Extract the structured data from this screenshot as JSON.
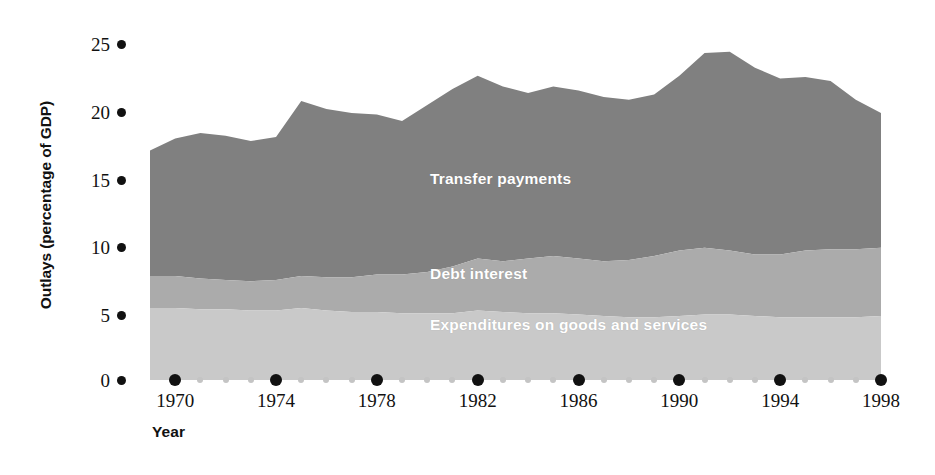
{
  "chart_data": {
    "type": "area",
    "title": "",
    "subtitle": "",
    "xlabel": "Year",
    "ylabel": "Outlays (percentage of GDP)",
    "xlim": [
      1969,
      1998
    ],
    "ylim": [
      0,
      26
    ],
    "grid": false,
    "legend_position": "inline-labels",
    "stacked": true,
    "annotations": [
      "Transfer payments",
      "Debt interest",
      "Expenditures on goods and services"
    ],
    "y_ticks": [
      0,
      5,
      10,
      15,
      20,
      25
    ],
    "x_ticks": [
      1970,
      1974,
      1978,
      1982,
      1986,
      1990,
      1994,
      1998
    ],
    "x_minor_ticks": [
      1971,
      1972,
      1973,
      1975,
      1976,
      1977,
      1979,
      1980,
      1981,
      1983,
      1984,
      1985,
      1987,
      1988,
      1989,
      1991,
      1992,
      1993,
      1995,
      1996,
      1997
    ],
    "x": [
      1969,
      1970,
      1971,
      1972,
      1973,
      1974,
      1975,
      1976,
      1977,
      1978,
      1979,
      1980,
      1981,
      1982,
      1983,
      1984,
      1985,
      1986,
      1987,
      1988,
      1989,
      1990,
      1991,
      1992,
      1993,
      1994,
      1995,
      1996,
      1997,
      1998
    ],
    "series": [
      {
        "name": "Expenditures on goods and services",
        "color": "#c9c9c9",
        "values": [
          5.4,
          5.4,
          5.3,
          5.3,
          5.2,
          5.2,
          5.4,
          5.2,
          5.1,
          5.1,
          5.0,
          5.0,
          5.0,
          5.2,
          5.1,
          5.0,
          5.0,
          4.9,
          4.8,
          4.7,
          4.7,
          4.8,
          4.9,
          4.9,
          4.8,
          4.7,
          4.7,
          4.7,
          4.7,
          4.8
        ]
      },
      {
        "name": "Debt interest",
        "color": "#ababab",
        "values": [
          2.4,
          2.4,
          2.3,
          2.2,
          2.2,
          2.3,
          2.4,
          2.5,
          2.6,
          2.8,
          2.9,
          3.1,
          3.5,
          3.9,
          3.8,
          4.1,
          4.3,
          4.2,
          4.1,
          4.3,
          4.6,
          4.9,
          5.0,
          4.8,
          4.6,
          4.7,
          5.0,
          5.1,
          5.1,
          5.1
        ]
      },
      {
        "name": "Transfer payments",
        "color": "#808080",
        "values": [
          9.4,
          10.3,
          10.9,
          10.8,
          10.5,
          10.7,
          13.1,
          12.6,
          12.3,
          12.0,
          11.5,
          12.5,
          13.3,
          13.7,
          13.1,
          12.4,
          12.7,
          12.6,
          12.3,
          12.0,
          12.1,
          13.1,
          14.6,
          14.9,
          14.0,
          13.2,
          13.0,
          12.6,
          11.2,
          10.1
        ]
      }
    ],
    "totals": [
      17.2,
      18.1,
      18.5,
      18.3,
      17.9,
      18.2,
      20.9,
      20.3,
      20.0,
      19.9,
      19.4,
      20.6,
      21.8,
      22.8,
      22.0,
      21.5,
      22.0,
      21.7,
      21.2,
      21.0,
      21.4,
      22.8,
      24.5,
      24.6,
      23.4,
      22.6,
      22.7,
      22.4,
      21.0,
      20.0
    ]
  },
  "axes": {
    "y_title": "Outlays (percentage of GDP)",
    "x_title": "Year",
    "y_tick_labels": [
      "25",
      "20",
      "15",
      "10",
      "5",
      "0"
    ],
    "x_tick_labels": [
      "1970",
      "1974",
      "1978",
      "1982",
      "1986",
      "1990",
      "1994",
      "1998"
    ]
  },
  "labels": {
    "transfer": "Transfer payments",
    "debt": "Debt interest",
    "expenditures": "Expenditures on goods and services"
  },
  "colors": {
    "transfer_payments": "#808080",
    "debt_interest": "#ababab",
    "expenditures": "#c9c9c9",
    "axis_text": "#111111",
    "minor_tick": "#c4c4c4",
    "background": "#ffffff"
  }
}
